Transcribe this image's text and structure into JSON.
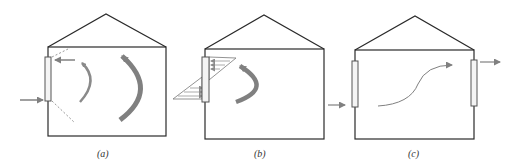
{
  "figure": {
    "panels": [
      {
        "id": "a",
        "caption": "(a)",
        "description": "Single-sided window: inflow at bottom, outflow at top, with recirculating airflow loops inside"
      },
      {
        "id": "b",
        "caption": "(b)",
        "description": "Single opening with neutral-plane velocity profile: air enters lower half, exits upper half, one recirculation loop"
      },
      {
        "id": "c",
        "caption": "(c)",
        "description": "Cross ventilation: air enters left window, flows across room, exits right window"
      }
    ],
    "colors": {
      "outline": "#2a2a2a",
      "arrow": "#808080",
      "dashed": "#9a9a9a",
      "window_fill": "#f4f4f4"
    }
  }
}
